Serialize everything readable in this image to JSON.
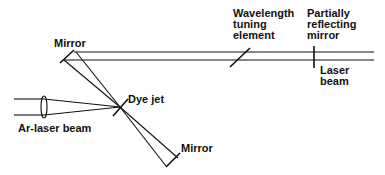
{
  "diagram": {
    "labels": {
      "mirror_top": "Mirror",
      "wavelength_1": "Wavelength",
      "wavelength_2": "tuning",
      "wavelength_3": "element",
      "partial_1": "Partially",
      "partial_2": "reflecting",
      "partial_3": "mirror",
      "laser_1": "Laser",
      "laser_2": "beam",
      "dye_jet": "Dye jet",
      "ar_beam": "Ar-laser beam",
      "mirror_bottom": "Mirror"
    },
    "colors": {
      "ink": "#111111",
      "background": "#ffffff"
    }
  }
}
